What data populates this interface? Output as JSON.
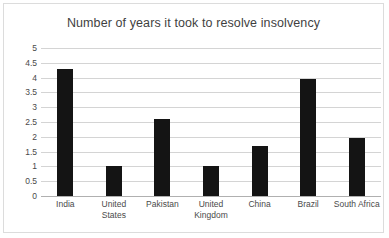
{
  "chart_data": {
    "type": "bar",
    "title": "Number of years it took to resolve insolvency",
    "xlabel": "",
    "ylabel": "",
    "categories": [
      "India",
      "United States",
      "Pakistan",
      "United Kingdom",
      "China",
      "Brazil",
      "South Africa"
    ],
    "values": [
      4.3,
      1.0,
      2.6,
      1.0,
      1.7,
      3.95,
      1.97
    ],
    "ylim": [
      0,
      5
    ],
    "ytick_values": [
      0,
      0.5,
      1,
      1.5,
      2,
      2.5,
      3,
      3.5,
      4,
      4.5,
      5
    ],
    "ytick_labels": [
      "0",
      "0.5",
      "1",
      "1.5",
      "2",
      "2.5",
      "3",
      "3.5",
      "4",
      "4.5",
      "5"
    ],
    "grid": true,
    "legend": false,
    "legend_position": "none",
    "series": [
      {
        "name": "Years to resolve insolvency",
        "values": [
          4.3,
          1.0,
          2.6,
          1.0,
          1.7,
          3.95,
          1.97
        ]
      }
    ],
    "colors": {
      "bar": "#141414",
      "gridline": "#d4d4d4",
      "axis": "#b0b0b0",
      "title_text": "#3f3f3f",
      "tick_text": "#4a4a4a",
      "plot_background": "#ffffff",
      "frame_border": "#dcdcdc"
    }
  }
}
